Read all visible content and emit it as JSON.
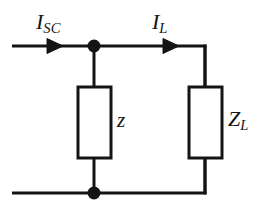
{
  "figure": {
    "type": "electrical-circuit-schematic",
    "background_color": "#ffffff",
    "line_color": "#141414",
    "width": 263,
    "height": 215
  },
  "labels": {
    "source_current": {
      "symbol": "I",
      "subscript": "SC"
    },
    "load_current": {
      "symbol": "I",
      "subscript": "L"
    },
    "source_impedance": {
      "symbol": "z",
      "subscript": ""
    },
    "load_impedance": {
      "symbol": "Z",
      "subscript": "L"
    }
  },
  "geometry": {
    "top_rail_y": 46,
    "bottom_rail_y": 193,
    "left_terminal_x": 12,
    "node_x": 94,
    "right_branch_x": 205,
    "source_arrow_x": 62,
    "load_arrow_x": 178,
    "box_top_y": 87,
    "box_bottom_y": 158,
    "left_box": {
      "x1": 78,
      "x2": 111
    },
    "right_box": {
      "x1": 189,
      "x2": 222
    },
    "node_radius": 6,
    "stroke_width": 3
  }
}
